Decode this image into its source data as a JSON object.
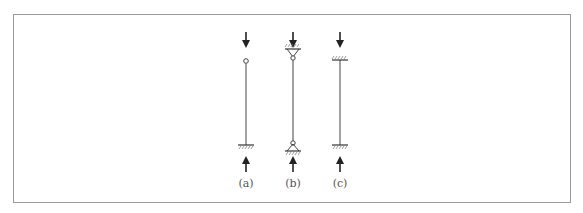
{
  "figure": {
    "columns": [
      {
        "id": "a",
        "label": "(a)",
        "top_support": "pin-end free",
        "bottom_support": "fixed"
      },
      {
        "id": "b",
        "label": "(b)",
        "top_support": "pinned",
        "bottom_support": "pinned"
      },
      {
        "id": "c",
        "label": "(c)",
        "top_support": "fixed",
        "bottom_support": "fixed"
      }
    ],
    "colors": {
      "line": "#333333",
      "frame": "#9a9a9a",
      "label": "#555555"
    }
  }
}
